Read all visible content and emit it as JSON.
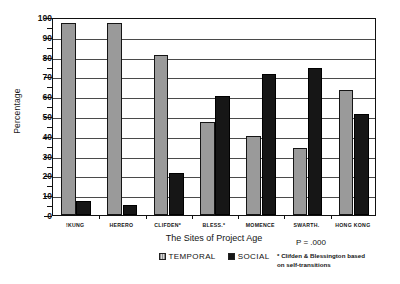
{
  "chart_data": {
    "type": "bar",
    "title": "",
    "xlabel": "The Sites of Project Age",
    "ylabel": "Percentage",
    "ylim": [
      0,
      100
    ],
    "ytick_step": 10,
    "yminor_step": 5,
    "grid": true,
    "legend_position": "below-center",
    "categories": [
      "!KUNG",
      "HERERO",
      "CLIFDEN*",
      "BLESS.*",
      "MOMENCE",
      "SWARTH.",
      "HONG KONG"
    ],
    "ytick_labels": [
      "0",
      "10",
      "20",
      "30",
      "40",
      "50",
      "60",
      "70",
      "80",
      "90",
      "100"
    ],
    "series": [
      {
        "name": "TEMPORAL",
        "color": "#9a9a9a",
        "values": [
          97,
          97,
          81,
          47,
          40,
          34,
          63
        ]
      },
      {
        "name": "SOCIAL",
        "color": "#161616",
        "values": [
          7,
          5,
          21,
          60,
          71,
          74,
          51
        ]
      }
    ],
    "annotations": {
      "pvalue": "P  =  .000",
      "footnote_line1": "* Clifden & Blessington based",
      "footnote_line2": "on self-transitions"
    }
  }
}
